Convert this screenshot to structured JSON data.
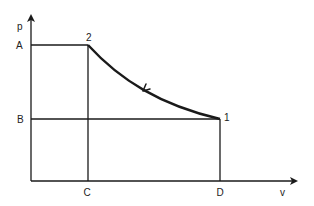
{
  "diagram": {
    "type": "p-v diagram",
    "axes": {
      "y_label": "p",
      "x_label": "v"
    },
    "y_ticks": [
      {
        "label": "A",
        "level": "upper pressure"
      },
      {
        "label": "B",
        "level": "lower pressure"
      }
    ],
    "x_ticks": [
      {
        "label": "C",
        "level": "smaller volume"
      },
      {
        "label": "D",
        "level": "larger volume"
      }
    ],
    "points": [
      {
        "label": "2",
        "p": "A",
        "v": "C"
      },
      {
        "label": "1",
        "p": "B",
        "v": "D"
      }
    ],
    "process": {
      "from": "1",
      "to": "2",
      "shape": "curve",
      "arrow_direction": "toward 2"
    },
    "colors": {
      "line": "#1a1a1a",
      "background": "#ffffff"
    }
  }
}
